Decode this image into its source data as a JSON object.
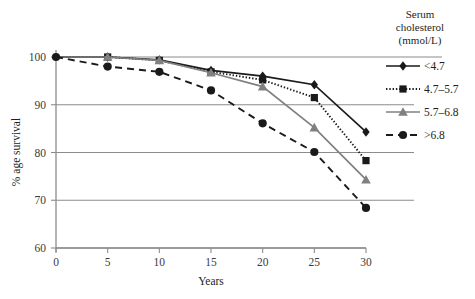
{
  "chart_data": {
    "type": "line",
    "title": "",
    "xlabel": "Years",
    "ylabel": "% age survival",
    "xlim": [
      0,
      30
    ],
    "ylim": [
      60,
      100
    ],
    "xticks": [
      "0",
      "5",
      "10",
      "15",
      "20",
      "25",
      "30"
    ],
    "yticks": [
      "60",
      "70",
      "80",
      "90",
      "100"
    ],
    "grid": "horizontal",
    "legend_position": "right",
    "legend_title": "Serum cholesterol (mmol/L)",
    "legend_title_lines": [
      "Serum",
      "cholesterol",
      "(mmol/L)"
    ],
    "x": [
      0,
      5,
      10,
      15,
      20,
      25,
      30
    ],
    "series": [
      {
        "name": "<4.7",
        "marker": "diamond",
        "style": "solid",
        "color": "#1a1a1a",
        "values": [
          100,
          100,
          99.4,
          97.2,
          96.0,
          94.2,
          84.3
        ]
      },
      {
        "name": "4.7–5.7",
        "marker": "square",
        "style": "dotted",
        "color": "#1a1a1a",
        "values": [
          100,
          100,
          99.3,
          96.9,
          95.2,
          91.5,
          78.3
        ]
      },
      {
        "name": "5.7–6.8",
        "marker": "triangle",
        "style": "solid",
        "color": "#808080",
        "values": [
          100,
          100,
          99.3,
          96.7,
          93.8,
          85.2,
          74.3
        ]
      },
      {
        "name": ">6.8",
        "marker": "circle",
        "style": "dashed",
        "color": "#1a1a1a",
        "values": [
          100,
          98.0,
          96.9,
          93.0,
          86.1,
          80.1,
          68.4
        ]
      }
    ]
  },
  "legend": {
    "title_lines": [
      "Serum",
      "cholesterol",
      "(mmol/L)"
    ],
    "entries": [
      {
        "label": "<4.7"
      },
      {
        "label": "4.7–5.7"
      },
      {
        "label": "5.7–6.8"
      },
      {
        "label": ">6.8"
      }
    ]
  },
  "axes": {
    "x_title": "Years",
    "y_title": "% age survival",
    "x_ticks": [
      "0",
      "5",
      "10",
      "15",
      "20",
      "25",
      "30"
    ],
    "y_ticks": [
      "100",
      "90",
      "80",
      "70",
      "60"
    ]
  },
  "colors": {
    "grid": "#8c8c8c",
    "axis": "#8c8c8c",
    "dark": "#1a1a1a",
    "gray_series": "#808080",
    "text": "#231f20",
    "tick_text": "#3b3b3b"
  }
}
